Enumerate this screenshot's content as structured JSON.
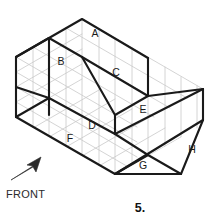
{
  "figure": {
    "kind": "isometric-pictorial-drawing",
    "number_label": "5.",
    "orientation_note": "FRONT",
    "surface_labels": [
      {
        "id": "A",
        "text": "A",
        "x": 95,
        "y": 34
      },
      {
        "id": "B",
        "text": "B",
        "x": 61,
        "y": 62
      },
      {
        "id": "C",
        "text": "C",
        "x": 116,
        "y": 73
      },
      {
        "id": "D",
        "text": "D",
        "x": 92,
        "y": 126
      },
      {
        "id": "E",
        "text": "E",
        "x": 143,
        "y": 110
      },
      {
        "id": "F",
        "text": "F",
        "x": 70,
        "y": 139
      },
      {
        "id": "G",
        "text": "G",
        "x": 143,
        "y": 166
      },
      {
        "id": "H",
        "text": "H",
        "x": 192,
        "y": 150
      }
    ],
    "arrow": {
      "name": "front-direction-arrow",
      "points": "12,177 38,161 33,160 40,157 36,165 34,161"
    },
    "colors": {
      "grid": "#c9c9c9",
      "outline": "#1a1a1a",
      "background": "#ffffff",
      "text": "#1a1a1a"
    },
    "geometry": {
      "grid_lines": [
        "M16,57 L82,19",
        "M16,72 L82,34",
        "M16,87 L82,49",
        "M49,100 L115,62",
        "M49,115 L115,77",
        "M82,134 L148,96",
        "M115,153 L181,115",
        "M82,19 L203,89",
        "M66,28 L187,98",
        "M49,38 L170,108",
        "M33,47 L154,117",
        "M16,57 L137,127",
        "M16,72 L137,142",
        "M16,87 L137,157",
        "M16,57 L16,87",
        "M33,47 L33,77",
        "M49,38 L49,115",
        "M66,28 L66,105",
        "M82,19 L82,134",
        "M99,29 L99,144",
        "M115,38 L115,153",
        "M132,48 L132,163",
        "M148,58 L148,173",
        "M165,67 L165,153",
        "M181,77 L181,143",
        "M197,86 L197,133",
        "M203,89 L203,120"
      ],
      "outline_paths": [
        "M16,87 L16,57 L82,19 L148,58 L148,72",
        "M16,57 L49,38",
        "M49,38 L49,115",
        "M82,57 L148,96 L148,58",
        "M82,57 L49,38",
        "M82,57 L115,115",
        "M115,115 L148,96",
        "M115,115 L82,134",
        "M148,96 L203,89",
        "M203,89 L203,120",
        "M16,87 L16,117 L115,174 L203,120",
        "M16,117 L49,98 L49,115",
        "M49,98 L115,134",
        "M115,134 L203,89",
        "M115,134 L115,174",
        "M115,174 L148,155 L181,174",
        "M148,155 L115,134",
        "M181,174 L203,120",
        "M115,174 L181,174"
      ]
    }
  }
}
